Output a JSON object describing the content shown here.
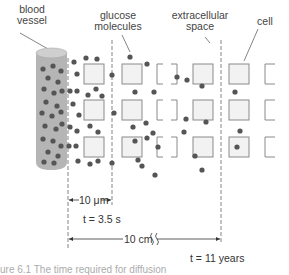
{
  "labels": {
    "blood_vessel": [
      "blood",
      "vessel"
    ],
    "glucose_molecules": [
      "glucose",
      "molecules"
    ],
    "extracellular_space": [
      "extracellular",
      "space"
    ],
    "cell": "cell"
  },
  "measurements": {
    "short_distance": "10 μm",
    "short_time": "t = 3.5 s",
    "long_distance": "10 cm",
    "long_time": "t = 11 years"
  },
  "caption": "ure 6.1 The time required for diffusion",
  "colors": {
    "vessel_fill": "#b5b5b5",
    "vessel_top": "#cfcfcf",
    "molecule": "#555555",
    "cell_fill": "#f2f2f2",
    "cell_stroke": "#8a8a8a",
    "dashed_line": "#777777"
  },
  "diagram": {
    "dashed_lines_x": [
      68,
      112,
      221
    ],
    "cell_columns": [
      {
        "x": 84,
        "style": "square"
      },
      {
        "x": 122,
        "style": "square"
      },
      {
        "x": 157,
        "style": "bracket"
      },
      {
        "x": 193,
        "style": "square"
      },
      {
        "x": 229,
        "style": "square"
      },
      {
        "x": 265,
        "style": "partial"
      }
    ],
    "cell_rows_y": [
      64,
      100,
      137
    ],
    "cell_size": 20
  }
}
